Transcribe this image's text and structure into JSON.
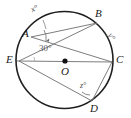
{
  "figure": {
    "center_point_label": "O",
    "stroke_color": "#3c3c3c",
    "circle_color": "#1f1f1f",
    "chord_color": "#6e6e6e",
    "label_color": "#1a1a1a",
    "background": "#ffffff"
  },
  "vertices": [
    {
      "id": "A",
      "label": "A",
      "x": 26,
      "y": 34
    },
    {
      "id": "B",
      "label": "B",
      "x": 98,
      "y": 16
    },
    {
      "id": "C",
      "label": "C",
      "x": 116,
      "y": 60
    },
    {
      "id": "D",
      "label": "D",
      "x": 92,
      "y": 108
    },
    {
      "id": "E",
      "label": "E",
      "x": 17,
      "y": 60
    },
    {
      "id": "O",
      "label": "O",
      "x": 66,
      "y": 66
    }
  ],
  "angles": [
    {
      "id": "x",
      "label": "x°",
      "at_vertex": "A",
      "x": 35,
      "y": 11
    },
    {
      "id": "y",
      "label": "y°",
      "at_vertex": "arc BC",
      "x": 107,
      "y": 32
    },
    {
      "id": "z",
      "label": "z°",
      "at_vertex": "D",
      "x": 81,
      "y": 85
    },
    {
      "id": "center",
      "label": "30°",
      "at_vertex": "E",
      "x": 41,
      "y": 48
    }
  ],
  "chords": [
    {
      "from": "A",
      "to": "B"
    },
    {
      "from": "A",
      "to": "C"
    },
    {
      "from": "E",
      "to": "B"
    },
    {
      "from": "E",
      "to": "C"
    },
    {
      "from": "E",
      "to": "D"
    },
    {
      "from": "D",
      "to": "C"
    }
  ]
}
